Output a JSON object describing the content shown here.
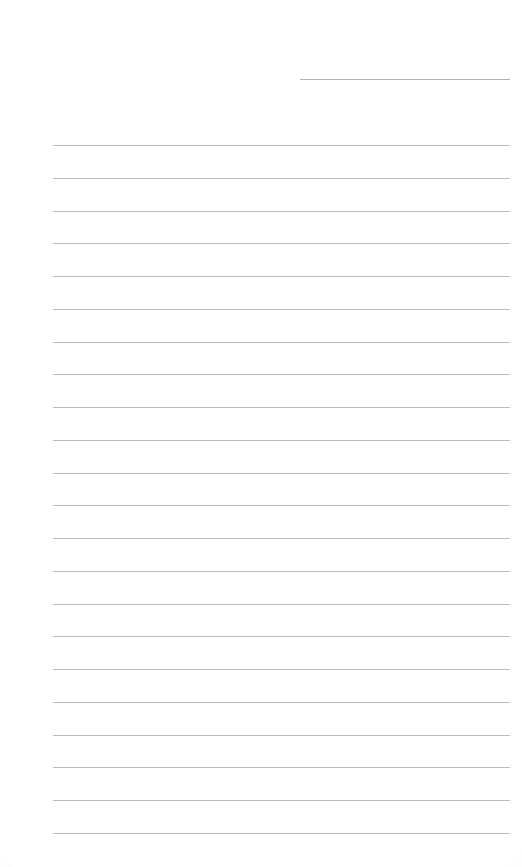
{
  "page": {
    "type": "lined-notepaper",
    "date_field": {
      "value": ""
    },
    "lines": {
      "count": 22,
      "first_y": 145,
      "spacing": 32.75,
      "left": 53,
      "right": 510,
      "color": "#bdbdbd"
    },
    "line_texts": [
      "",
      "",
      "",
      "",
      "",
      "",
      "",
      "",
      "",
      "",
      "",
      "",
      "",
      "",
      "",
      "",
      "",
      "",
      "",
      "",
      "",
      ""
    ]
  }
}
